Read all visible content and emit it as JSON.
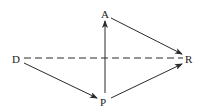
{
  "diagram": {
    "nodes": [
      {
        "id": "A",
        "label": "A",
        "x": 105,
        "y": 14
      },
      {
        "id": "D",
        "label": "D",
        "x": 17,
        "y": 59
      },
      {
        "id": "R",
        "label": "R",
        "x": 189,
        "y": 59
      },
      {
        "id": "P",
        "label": "P",
        "x": 104,
        "y": 101
      }
    ],
    "edges": [
      {
        "from": "A",
        "to": "R",
        "style": "solid",
        "arrow": "end"
      },
      {
        "from": "D",
        "to": "P",
        "style": "solid",
        "arrow": "end"
      },
      {
        "from": "P",
        "to": "R",
        "style": "solid",
        "arrow": "end"
      },
      {
        "from": "P",
        "to": "A",
        "style": "solid",
        "arrow": "end"
      },
      {
        "from": "D",
        "to": "R",
        "style": "dashed",
        "arrow": "none"
      }
    ],
    "colors": {
      "line": "#2a2a2a",
      "text": "#1a1a1a",
      "background": "#ffffff"
    }
  }
}
